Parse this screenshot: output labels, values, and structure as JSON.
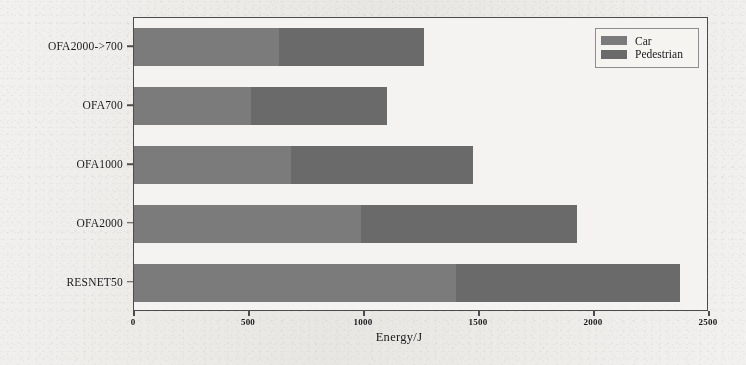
{
  "chart_data": {
    "type": "bar",
    "orientation": "horizontal",
    "stacked": true,
    "title": "",
    "xlabel": "Energy/J",
    "ylabel": "",
    "xlim": [
      0,
      2500
    ],
    "ylim": null,
    "grid": false,
    "legend_position": "top-right",
    "categories": [
      "OFA2000->700",
      "OFA700",
      "OFA1000",
      "OFA2000",
      "RESNET50"
    ],
    "xticks": [
      0,
      500,
      1000,
      1500,
      2000,
      2500
    ],
    "xtick_labels": [
      "0",
      "500",
      "1000",
      "1500",
      "2000",
      "2500"
    ],
    "series": [
      {
        "name": "Car",
        "color": "#7b7b7b",
        "values": [
          630,
          510,
          683,
          988,
          1402
        ]
      },
      {
        "name": "Pedestrian",
        "color": "#6a6a6a",
        "values": [
          633,
          588,
          793,
          937,
          972
        ]
      }
    ],
    "totals": [
      1263,
      1098,
      1476,
      1925,
      2374
    ]
  },
  "legend": {
    "items": [
      {
        "label": "Car"
      },
      {
        "label": "Pedestrian"
      }
    ]
  },
  "axis": {
    "x_title": "Energy/J"
  }
}
